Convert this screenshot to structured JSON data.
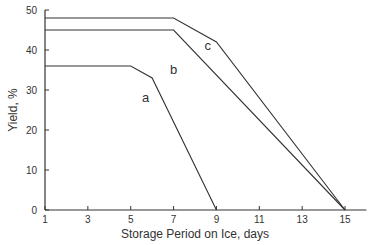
{
  "chart_data": {
    "type": "line",
    "title": "",
    "xlabel": "Storage Period on Ice, days",
    "ylabel": "Yield, %",
    "xlim": [
      1,
      16
    ],
    "ylim": [
      0,
      50
    ],
    "x_ticks": [
      1,
      3,
      5,
      7,
      9,
      11,
      13,
      15
    ],
    "y_ticks": [
      0,
      10,
      20,
      30,
      40,
      50
    ],
    "grid": false,
    "legend": "inline labels",
    "series": [
      {
        "name": "a",
        "points": [
          [
            1,
            36
          ],
          [
            5,
            36
          ],
          [
            6,
            33
          ],
          [
            9,
            0
          ]
        ]
      },
      {
        "name": "b",
        "points": [
          [
            1,
            45
          ],
          [
            7,
            45
          ],
          [
            15,
            0
          ]
        ]
      },
      {
        "name": "c",
        "points": [
          [
            1,
            48
          ],
          [
            7,
            48
          ],
          [
            9,
            42
          ],
          [
            15,
            0
          ]
        ]
      }
    ],
    "annotations": [
      {
        "text": "a",
        "x": 5.7,
        "y": 27
      },
      {
        "text": "b",
        "x": 7,
        "y": 34
      },
      {
        "text": "c",
        "x": 8.6,
        "y": 40
      }
    ]
  }
}
